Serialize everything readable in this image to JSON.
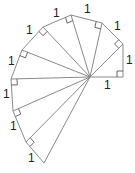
{
  "diagram": {
    "type": "spiral-of-theodorus",
    "colors": {
      "line": "#8a8a8a",
      "right_angle": "#555555",
      "label": "#222222"
    },
    "center": [
      90,
      77
    ],
    "vertices": [
      [
        123,
        77
      ],
      [
        123,
        44
      ],
      [
        102,
        23
      ],
      [
        71,
        15
      ],
      [
        43,
        27
      ],
      [
        22,
        50
      ],
      [
        11,
        79
      ],
      [
        13,
        111
      ],
      [
        26,
        142
      ],
      [
        44,
        163
      ]
    ],
    "labels": [
      {
        "text": "1",
        "x": 104,
        "y": 89
      },
      {
        "text": "1",
        "x": 126,
        "y": 64
      },
      {
        "text": "1",
        "x": 114,
        "y": 30
      },
      {
        "text": "1",
        "x": 84,
        "y": 13
      },
      {
        "text": "1",
        "x": 53,
        "y": 17
      },
      {
        "text": "1",
        "x": 26,
        "y": 34
      },
      {
        "text": "1",
        "x": 8,
        "y": 65
      },
      {
        "text": "1",
        "x": 3,
        "y": 98
      },
      {
        "text": "1",
        "x": 10,
        "y": 130
      },
      {
        "text": "1",
        "x": 28,
        "y": 162
      }
    ]
  }
}
